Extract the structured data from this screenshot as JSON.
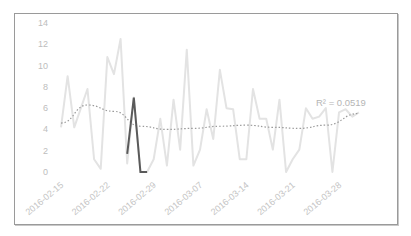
{
  "chart_data": {
    "type": "line",
    "title": "",
    "xlabel": "",
    "ylabel": "",
    "ylim": [
      0,
      14
    ],
    "yticks": [
      0,
      2,
      4,
      6,
      8,
      10,
      12,
      14
    ],
    "grid": false,
    "legend": null,
    "xtick_labels": [
      "2016-02-15",
      "2016-02-22",
      "2016-02-29",
      "2016-03-07",
      "2016-03-14",
      "2016-03-21",
      "2016-03-28"
    ],
    "series": [
      {
        "name": "daily values",
        "color": "#e3e3e3",
        "x_start": "2016-02-15",
        "values": [
          4.2,
          9.0,
          4.2,
          6.0,
          7.8,
          1.2,
          0.3,
          10.8,
          9.2,
          12.5,
          0.8,
          7.0,
          0.0,
          0.0,
          1.2,
          5.0,
          0.6,
          6.8,
          2.1,
          11.5,
          0.6,
          2.1,
          5.9,
          3.1,
          9.6,
          6.0,
          5.9,
          1.2,
          1.2,
          7.8,
          5.0,
          5.0,
          2.1,
          6.8,
          0.0,
          1.2,
          2.1,
          6.0,
          5.0,
          5.2,
          6.0,
          0.0,
          5.6,
          5.9,
          5.2,
          5.6
        ]
      },
      {
        "name": "highlighted segment",
        "color": "#5a5a5a",
        "points": [
          [
            10,
            1.7
          ],
          [
            11,
            7.0
          ],
          [
            12,
            0.0
          ],
          [
            13,
            0.0
          ]
        ]
      },
      {
        "name": "polynomial trendline",
        "color": "#9a9a9a",
        "style": "dotted",
        "values_at": [
          [
            0,
            4.6
          ],
          [
            4,
            6.3
          ],
          [
            8,
            5.7
          ],
          [
            12,
            4.3
          ],
          [
            16,
            4.0
          ],
          [
            20,
            4.1
          ],
          [
            24,
            4.3
          ],
          [
            28,
            4.4
          ],
          [
            32,
            4.2
          ],
          [
            36,
            4.1
          ],
          [
            40,
            4.4
          ],
          [
            45,
            5.5
          ]
        ]
      }
    ],
    "annotations": [
      {
        "text": "R² = 0.0519",
        "position": "upper-right of trendline"
      }
    ]
  }
}
